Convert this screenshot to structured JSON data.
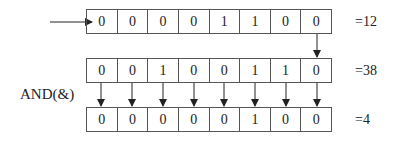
{
  "operation": {
    "label": "AND(&)"
  },
  "rows": [
    {
      "name": "operand-a",
      "bits": [
        "0",
        "0",
        "0",
        "0",
        "1",
        "1",
        "0",
        "0"
      ],
      "result": "=12"
    },
    {
      "name": "operand-b",
      "bits": [
        "0",
        "0",
        "1",
        "0",
        "0",
        "1",
        "1",
        "0"
      ],
      "result": "=38"
    },
    {
      "name": "and-result",
      "bits": [
        "0",
        "0",
        "0",
        "0",
        "0",
        "1",
        "0",
        "0"
      ],
      "result": "=4"
    }
  ]
}
